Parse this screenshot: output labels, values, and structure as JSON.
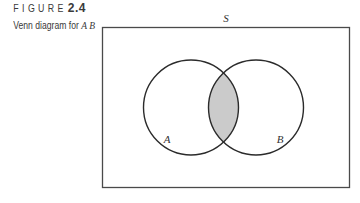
{
  "caption": {
    "figure_word": "FIGURE",
    "figure_number": "2.4",
    "subtitle_prefix": "Venn diagram for",
    "subtitle_symbol": "A B"
  },
  "diagram": {
    "universe_label": "S",
    "set_a_label": "A",
    "set_b_label": "B",
    "shaded_region": "intersection of A and B",
    "colors": {
      "stroke": "#2b2b2b",
      "frame_stroke": "#4a4a4a",
      "shade": "#cbcbcb",
      "background": "#ffffff"
    }
  }
}
